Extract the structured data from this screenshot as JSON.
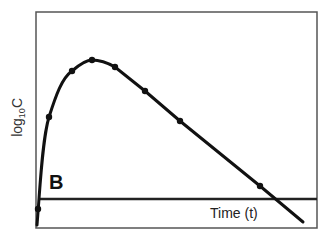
{
  "chart_data": {
    "type": "line",
    "title": "",
    "panel_label": "B",
    "xlabel": "Time (t)",
    "ylabel": "log10C",
    "ylabel_parts": {
      "base": "log",
      "sub": "10",
      "suffix": "C"
    },
    "grid": false,
    "legend": null,
    "x_ticks": [],
    "y_ticks": [],
    "series": [
      {
        "name": "concentration curve",
        "description": "Rapid rise to peak then linear decline (log-scale), crossing baseline",
        "points_px": [
          [
            38,
            209
          ],
          [
            49,
            117
          ],
          [
            72,
            71
          ],
          [
            92,
            60
          ],
          [
            115,
            67
          ],
          [
            145,
            91
          ],
          [
            180,
            121
          ],
          [
            260,
            186
          ]
        ],
        "x_rel": [
          0.01,
          0.05,
          0.13,
          0.2,
          0.28,
          0.39,
          0.51,
          0.8
        ],
        "y_rel": [
          0.1,
          0.54,
          0.76,
          0.81,
          0.78,
          0.66,
          0.52,
          0.22
        ]
      }
    ],
    "baseline": {
      "y_px": 199,
      "description": "horizontal threshold line"
    }
  },
  "labels": {
    "xlabel": "Time (t)",
    "ylabel_base": "log",
    "ylabel_sub": "10",
    "ylabel_suffix": "C",
    "panel": "B"
  }
}
